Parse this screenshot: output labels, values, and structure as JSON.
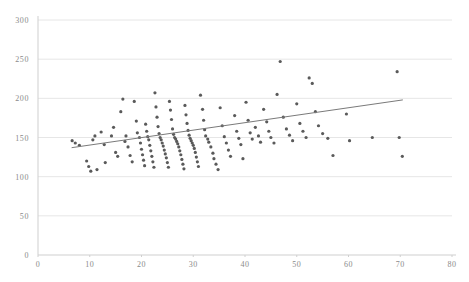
{
  "chart_data": {
    "type": "scatter",
    "title": "",
    "subtitle": "",
    "xlabel": "",
    "ylabel": "",
    "xlim": [
      0,
      80
    ],
    "ylim": [
      0,
      300
    ],
    "grid": true,
    "legend": null,
    "legend_position": "none",
    "point_color": "#5a5a5a",
    "point_size": 3.2,
    "grid_color": "#e6e6e6",
    "axis_color": "#cfcfcf",
    "trendline_color": "#7a7a7a",
    "xticks": [
      0,
      10,
      20,
      30,
      40,
      50,
      60,
      70,
      80
    ],
    "xtick_labels": [
      "0",
      "10",
      "20",
      "30",
      "40",
      "50",
      "60",
      "70",
      "80"
    ],
    "yticks": [
      0,
      50,
      100,
      150,
      200,
      250,
      300
    ],
    "ytick_labels": [
      "0",
      "50",
      "100",
      "150",
      "200",
      "250",
      "300"
    ],
    "trendline": {
      "type": "line",
      "x": [
        6.5,
        70.5
      ],
      "y": [
        137,
        198
      ]
    },
    "series": [
      {
        "name": "observations",
        "points": [
          [
            6.6,
            146
          ],
          [
            7.2,
            143
          ],
          [
            8.0,
            140
          ],
          [
            9.4,
            120
          ],
          [
            9.8,
            113
          ],
          [
            10.2,
            107
          ],
          [
            10.6,
            147
          ],
          [
            11.0,
            152
          ],
          [
            11.4,
            109
          ],
          [
            12.2,
            157
          ],
          [
            12.8,
            141
          ],
          [
            13.0,
            118
          ],
          [
            14.2,
            152
          ],
          [
            14.6,
            163
          ],
          [
            15.0,
            131
          ],
          [
            15.4,
            126
          ],
          [
            16.0,
            183
          ],
          [
            16.4,
            199
          ],
          [
            16.8,
            145
          ],
          [
            17.0,
            152
          ],
          [
            17.4,
            138
          ],
          [
            17.8,
            127
          ],
          [
            18.2,
            119
          ],
          [
            18.6,
            196
          ],
          [
            19.0,
            171
          ],
          [
            19.2,
            156
          ],
          [
            19.6,
            150
          ],
          [
            19.8,
            143
          ],
          [
            20.0,
            135
          ],
          [
            20.2,
            128
          ],
          [
            20.4,
            121
          ],
          [
            20.6,
            114
          ],
          [
            20.8,
            167
          ],
          [
            21.0,
            158
          ],
          [
            21.2,
            151
          ],
          [
            21.4,
            147
          ],
          [
            21.6,
            140
          ],
          [
            21.8,
            133
          ],
          [
            22.0,
            126
          ],
          [
            22.2,
            119
          ],
          [
            22.4,
            112
          ],
          [
            22.6,
            207
          ],
          [
            22.8,
            189
          ],
          [
            23.0,
            176
          ],
          [
            23.2,
            164
          ],
          [
            23.4,
            155
          ],
          [
            23.6,
            150
          ],
          [
            23.8,
            147
          ],
          [
            24.0,
            143
          ],
          [
            24.2,
            139
          ],
          [
            24.4,
            134
          ],
          [
            24.6,
            129
          ],
          [
            24.8,
            124
          ],
          [
            25.0,
            118
          ],
          [
            25.2,
            112
          ],
          [
            25.4,
            196
          ],
          [
            25.6,
            185
          ],
          [
            25.8,
            173
          ],
          [
            26.0,
            161
          ],
          [
            26.2,
            154
          ],
          [
            26.4,
            150
          ],
          [
            26.6,
            148
          ],
          [
            26.8,
            145
          ],
          [
            27.0,
            142
          ],
          [
            27.2,
            138
          ],
          [
            27.4,
            133
          ],
          [
            27.6,
            128
          ],
          [
            27.8,
            122
          ],
          [
            28.0,
            116
          ],
          [
            28.2,
            110
          ],
          [
            28.4,
            191
          ],
          [
            28.6,
            179
          ],
          [
            28.8,
            168
          ],
          [
            29.0,
            159
          ],
          [
            29.2,
            153
          ],
          [
            29.4,
            149
          ],
          [
            29.6,
            146
          ],
          [
            29.8,
            143
          ],
          [
            30.0,
            140
          ],
          [
            30.2,
            136
          ],
          [
            30.4,
            131
          ],
          [
            30.6,
            125
          ],
          [
            30.8,
            119
          ],
          [
            31.0,
            113
          ],
          [
            31.4,
            204
          ],
          [
            31.8,
            186
          ],
          [
            32.0,
            172
          ],
          [
            32.2,
            160
          ],
          [
            32.4,
            152
          ],
          [
            32.8,
            148
          ],
          [
            33.0,
            144
          ],
          [
            33.4,
            138
          ],
          [
            33.8,
            130
          ],
          [
            34.0,
            123
          ],
          [
            34.4,
            116
          ],
          [
            34.8,
            109
          ],
          [
            35.2,
            188
          ],
          [
            35.6,
            165
          ],
          [
            36.0,
            151
          ],
          [
            36.4,
            143
          ],
          [
            36.8,
            134
          ],
          [
            37.2,
            126
          ],
          [
            38.0,
            178
          ],
          [
            38.4,
            158
          ],
          [
            38.8,
            149
          ],
          [
            39.2,
            141
          ],
          [
            39.6,
            123
          ],
          [
            40.2,
            195
          ],
          [
            40.6,
            172
          ],
          [
            41.0,
            156
          ],
          [
            41.4,
            148
          ],
          [
            42.0,
            163
          ],
          [
            42.6,
            152
          ],
          [
            43.0,
            144
          ],
          [
            43.6,
            186
          ],
          [
            44.2,
            170
          ],
          [
            44.6,
            158
          ],
          [
            45.0,
            150
          ],
          [
            45.6,
            143
          ],
          [
            46.2,
            205
          ],
          [
            46.8,
            247
          ],
          [
            47.4,
            176
          ],
          [
            48.0,
            161
          ],
          [
            48.6,
            153
          ],
          [
            49.2,
            146
          ],
          [
            50.0,
            193
          ],
          [
            50.6,
            168
          ],
          [
            51.2,
            158
          ],
          [
            51.8,
            150
          ],
          [
            52.4,
            226
          ],
          [
            53.0,
            219
          ],
          [
            53.6,
            183
          ],
          [
            54.2,
            165
          ],
          [
            55.0,
            155
          ],
          [
            56.0,
            149
          ],
          [
            57.0,
            127
          ],
          [
            59.6,
            180
          ],
          [
            60.2,
            146
          ],
          [
            64.6,
            150
          ],
          [
            69.4,
            234
          ],
          [
            69.8,
            150
          ],
          [
            70.4,
            126
          ]
        ]
      }
    ]
  },
  "geometry": {
    "plot_left": 38,
    "plot_right": 452,
    "plot_top": 20,
    "plot_bottom": 255
  }
}
